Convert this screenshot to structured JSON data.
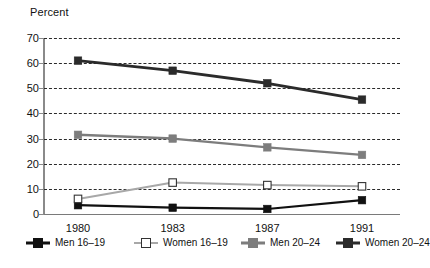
{
  "chart_data": {
    "type": "line",
    "title": "",
    "subtitle": "",
    "xlabel": "",
    "ylabel": "Percent",
    "ylim": [
      0,
      70
    ],
    "ytick_step": 10,
    "yticks": [
      0,
      10,
      20,
      30,
      40,
      50,
      60,
      70
    ],
    "categories": [
      "1980",
      "1983",
      "1987",
      "1991"
    ],
    "x": [
      1980,
      1983,
      1987,
      1991
    ],
    "grid": "horizontal-dashed",
    "legend_position": "below-axis",
    "series": [
      {
        "name": "Men 16–19",
        "values": [
          3.5,
          2.5,
          2.0,
          5.5
        ],
        "marker": "filled-square",
        "color": "#111111",
        "line_width": 2.2
      },
      {
        "name": "Women 16–19",
        "values": [
          6.0,
          12.5,
          11.5,
          11.0
        ],
        "marker": "open-square",
        "color": "#a8a8a8",
        "line_width": 2.0
      },
      {
        "name": "Men 20–24",
        "values": [
          31.5,
          30.0,
          26.5,
          23.5
        ],
        "marker": "filled-square",
        "color": "#7d7d7d",
        "line_width": 2.4
      },
      {
        "name": "Women 20–24",
        "values": [
          61.0,
          57.0,
          52.0,
          45.5
        ],
        "marker": "filled-square",
        "color": "#2b2b2b",
        "line_width": 2.8
      }
    ]
  },
  "legend": {
    "items": [
      {
        "label": "Men 16–19",
        "marker": "filled-square",
        "color": "#111111"
      },
      {
        "label": "Women 16–19",
        "marker": "open-square",
        "color": "#a8a8a8"
      },
      {
        "label": "Men 20–24",
        "marker": "filled-square",
        "color": "#7d7d7d"
      },
      {
        "label": "Women 20–24",
        "marker": "filled-square",
        "color": "#2b2b2b"
      }
    ]
  },
  "caption": {
    "text": ""
  }
}
